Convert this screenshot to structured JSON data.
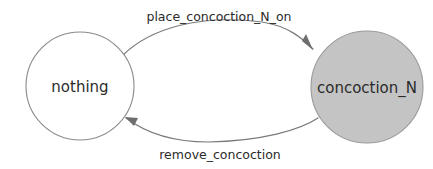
{
  "diagram": {
    "type": "state-transition-diagram",
    "background_color": "#ffffff",
    "states": [
      {
        "id": "nothing",
        "label": "nothing",
        "fill": "#ffffff",
        "stroke": "#8a8a8a",
        "cx": 80,
        "cy": 86,
        "r": 54
      },
      {
        "id": "concoction_N",
        "label": "concoction_N",
        "fill": "#c4c4c4",
        "stroke": "#9a9a9a",
        "cx": 367,
        "cy": 87,
        "r": 56
      }
    ],
    "transitions": [
      {
        "id": "place",
        "label": "place_concoction_N_on",
        "from": "nothing",
        "to": "concoction_N",
        "color": "#7a7a7a",
        "label_x": 219,
        "label_y": 17,
        "path": "M 122 56 C 150 28 200 14 262 22 C 288 26 302 38 313 49",
        "arrow_points": "313,50 302,41 306,34"
      },
      {
        "id": "remove",
        "label": "remove_concoction",
        "from": "concoction_N",
        "to": "nothing",
        "color": "#7a7a7a",
        "label_x": 220,
        "label_y": 155,
        "path": "M 318 118 C 300 130 262 141 208 142 C 168 142 142 130 126 118",
        "arrow_points": "125,117 138,118 134,126"
      }
    ]
  }
}
